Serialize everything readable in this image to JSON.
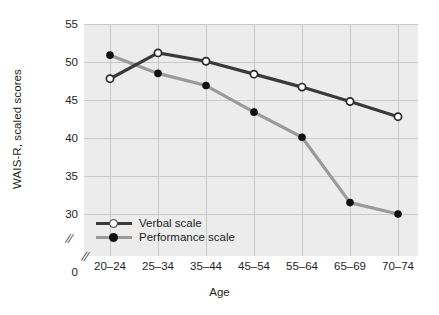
{
  "chart_data": {
    "type": "line",
    "title": "",
    "xlabel": "Age",
    "ylabel": "WAIS-R, scaled scores",
    "categories": [
      "20–24",
      "25–34",
      "35–44",
      "45–54",
      "55–64",
      "65–69",
      "70–74"
    ],
    "ytick_labels": [
      "55",
      "50",
      "45",
      "40",
      "35",
      "30",
      "0"
    ],
    "ytick_values": [
      55,
      50,
      45,
      40,
      35,
      30,
      0
    ],
    "ylim": [
      28.5,
      56.5
    ],
    "axis_break": "//",
    "grid": true,
    "legend_position": "bottom-left inside",
    "series": [
      {
        "name": "Verbal scale",
        "values": [
          47.8,
          51.2,
          50.1,
          48.4,
          46.7,
          44.8,
          42.8
        ],
        "color": "#3a3a3a",
        "marker": "open-circle"
      },
      {
        "name": "Performance scale",
        "values": [
          50.9,
          48.5,
          46.9,
          43.4,
          40.1,
          31.5,
          30.0
        ],
        "color": "#9a9a9a",
        "marker": "filled-circle"
      }
    ]
  },
  "colors": {
    "plot_background": "#ececec",
    "gridline": "#c9c9c9",
    "text": "#231f20",
    "verbal": "#3a3a3a",
    "performance": "#9a9a9a"
  }
}
